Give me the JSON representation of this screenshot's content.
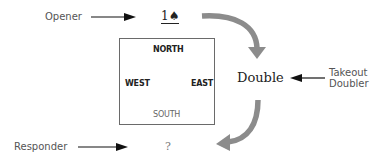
{
  "diagram": {
    "type": "bridge-bidding-diagram",
    "seats": {
      "north": "NORTH",
      "west": "WEST",
      "east": "EAST",
      "south": "SOUTH"
    },
    "bids": {
      "opener_bid": "1♠",
      "overcall": "Double",
      "responder_bid": "?"
    },
    "roles": {
      "opener": "Opener",
      "takeout_doubler_line1": "Takeout",
      "takeout_doubler_line2": "Doubler",
      "responder": "Responder"
    },
    "colors": {
      "pointer_arrow": "#111111",
      "flow_arrow": "#8c8c8c",
      "box_border": "#6a6a6a",
      "role_text": "#555555"
    }
  }
}
